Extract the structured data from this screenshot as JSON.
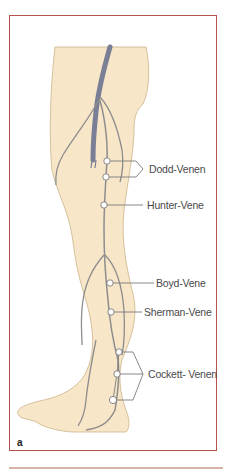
{
  "figure": {
    "panel_letter": "a",
    "colors": {
      "frame": "#b5534f",
      "skin": "#f8e6c8",
      "skin_outline": "#cdb48a",
      "vein_deep": "#7b7f96",
      "vein_superficial": "#8d8d8d",
      "label_text": "#4a4a4a"
    },
    "labels": [
      {
        "id": "dodd",
        "text": "Dodd-Venen"
      },
      {
        "id": "hunter",
        "text": "Hunter-Vene"
      },
      {
        "id": "boyd",
        "text": "Boyd-Vene"
      },
      {
        "id": "sherman",
        "text": "Sherman-Vene"
      },
      {
        "id": "cockett",
        "text": "Cockett- Venen"
      }
    ]
  }
}
